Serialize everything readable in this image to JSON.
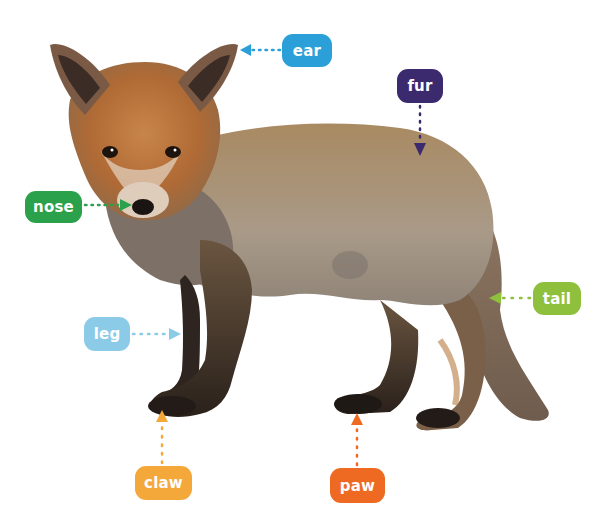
{
  "diagram": {
    "labels": [
      {
        "id": "ear",
        "text": "ear",
        "color": "#2a9fd8",
        "x": 282,
        "y": 34,
        "w": 50,
        "h": 33,
        "arrow_dir": "left",
        "target": [
          240,
          50
        ]
      },
      {
        "id": "fur",
        "text": "fur",
        "color": "#3b2a6e",
        "x": 397,
        "y": 69,
        "w": 46,
        "h": 34,
        "arrow_dir": "down",
        "target": [
          420,
          155
        ]
      },
      {
        "id": "nose",
        "text": "nose",
        "color": "#2aa14a",
        "x": 25,
        "y": 191,
        "w": 57,
        "h": 32,
        "arrow_dir": "right",
        "target": [
          132,
          205
        ]
      },
      {
        "id": "leg",
        "text": "leg",
        "color": "#8ccbe8",
        "x": 84,
        "y": 317,
        "w": 46,
        "h": 34,
        "arrow_dir": "right",
        "target": [
          181,
          334
        ]
      },
      {
        "id": "tail",
        "text": "tail",
        "color": "#8fc03d",
        "x": 533,
        "y": 282,
        "w": 48,
        "h": 33,
        "arrow_dir": "left",
        "target": [
          490,
          298
        ]
      },
      {
        "id": "claw",
        "text": "claw",
        "color": "#f5a83a",
        "x": 135,
        "y": 466,
        "w": 57,
        "h": 34,
        "arrow_dir": "up",
        "target": [
          162,
          410
        ]
      },
      {
        "id": "paw",
        "text": "paw",
        "color": "#ee6a22",
        "x": 330,
        "y": 468,
        "w": 55,
        "h": 35,
        "arrow_dir": "up",
        "target": [
          357,
          413
        ]
      }
    ]
  }
}
